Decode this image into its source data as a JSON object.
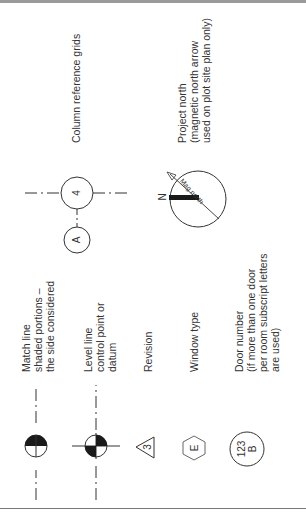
{
  "page": {
    "orientation": "rotated-90-ccw",
    "colors": {
      "ink": "#333333",
      "fill": "#1a1a1a",
      "rule": "#777777",
      "topbar": "#9a9a9a"
    }
  },
  "legend": [
    {
      "id": "match-line",
      "symbol": "half-filled-circle-on-dashed-line",
      "label_lines": [
        "Match line",
        "shaded portions –",
        "the side considered"
      ]
    },
    {
      "id": "level-line",
      "symbol": "quartered-circle-crosshair",
      "label_lines": [
        "Level line",
        "control point or",
        "datum"
      ]
    },
    {
      "id": "revision",
      "symbol": "triangle",
      "symbol_text": "3",
      "label_lines": [
        "Revision"
      ]
    },
    {
      "id": "window-type",
      "symbol": "hexagon",
      "symbol_text": "E",
      "label_lines": [
        "Window type"
      ]
    },
    {
      "id": "door-number",
      "symbol": "circle",
      "symbol_text_lines": [
        "123",
        "B"
      ],
      "label_lines": [
        "Door number",
        "(if more than one door",
        "per room subscript letters",
        "are used)"
      ]
    },
    {
      "id": "column-grid",
      "symbol": "grid-bubbles",
      "bubbles": [
        "4",
        "A"
      ],
      "label_lines": [
        "Column reference grids"
      ]
    },
    {
      "id": "project-north",
      "symbol": "north-arrow",
      "north_letter": "N",
      "arrow_text": "Mag north",
      "label_lines": [
        "Project north",
        "(magnetic north arrow",
        "used on plot site plan only)"
      ]
    }
  ]
}
